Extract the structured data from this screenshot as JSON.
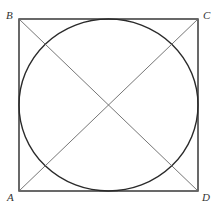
{
  "diagram": {
    "colors": {
      "background": "#ffffff",
      "square": "#2a2a2a",
      "circle": "#2a2a2a",
      "diagonals": "#666666",
      "labels": "#333333"
    },
    "vertices": {
      "A": {
        "label": "A",
        "x": 19,
        "y": 191
      },
      "B": {
        "label": "B",
        "x": 19,
        "y": 19
      },
      "C": {
        "label": "C",
        "x": 198,
        "y": 19
      },
      "D": {
        "label": "D",
        "x": 198,
        "y": 191
      }
    },
    "labels": [
      {
        "id": "B",
        "text": "B",
        "x": 6,
        "y": 19
      },
      {
        "id": "C",
        "text": "C",
        "x": 203,
        "y": 19
      },
      {
        "id": "A",
        "text": "A",
        "x": 7,
        "y": 201
      },
      {
        "id": "D",
        "text": "D",
        "x": 202,
        "y": 201
      }
    ],
    "circle": {
      "cx": 108.5,
      "cy": 105,
      "rx": 89.5,
      "ry": 86
    },
    "diagonals": [
      {
        "from": "A",
        "to": "C"
      },
      {
        "from": "B",
        "to": "D"
      }
    ]
  }
}
